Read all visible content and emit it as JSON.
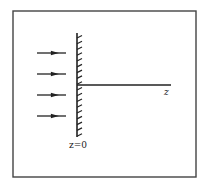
{
  "diagram": {
    "type": "physics-schematic",
    "frame": {
      "x": 13,
      "y": 11,
      "width": 183,
      "height": 166,
      "stroke": "#444444"
    },
    "wall": {
      "x": 77,
      "y_top": 33,
      "y_bottom": 137,
      "hatch_count": 18,
      "hatch_side": "right",
      "color": "#222222"
    },
    "axis": {
      "x1": 77,
      "x2": 171,
      "y": 85,
      "label": "z",
      "color": "#222222"
    },
    "arrows": [
      {
        "y": 53,
        "x1": 37,
        "x2": 66
      },
      {
        "y": 74,
        "x1": 37,
        "x2": 66
      },
      {
        "y": 95,
        "x1": 37,
        "x2": 66
      },
      {
        "y": 116,
        "x1": 37,
        "x2": 66
      }
    ],
    "labels": {
      "wall_position": "z=0",
      "axis": "z"
    }
  }
}
